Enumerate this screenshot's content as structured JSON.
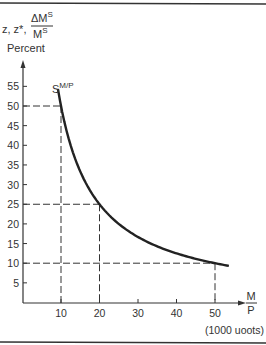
{
  "chart_data": {
    "type": "line",
    "title": "",
    "ylabel_lines": [
      "z, z*,",
      "ΔM",
      "S",
      "M",
      "S",
      "Percent"
    ],
    "ylabel": "z, z*, ΔM^S/M^S Percent",
    "xlabel": "M/P",
    "xlabel_num": "M",
    "xlabel_den": "P",
    "x_unit_note": "(1000 uoots)",
    "xlim": [
      0,
      55
    ],
    "ylim": [
      0,
      57
    ],
    "x_ticks": [
      10,
      20,
      30,
      40,
      50
    ],
    "y_ticks": [
      5,
      10,
      15,
      20,
      25,
      30,
      35,
      40,
      45,
      50,
      55
    ],
    "grid": false,
    "series": [
      {
        "name": "S^{M/P}",
        "label_base": "S",
        "label_sup": "M/P",
        "function": "y = 500 / x",
        "x_range": [
          9.2,
          53.6
        ],
        "x": [
          9.2,
          10,
          12,
          15,
          20,
          25,
          30,
          35,
          40,
          45,
          50,
          53.6
        ],
        "y": [
          54.3,
          50,
          41.7,
          33.3,
          25,
          20,
          16.7,
          14.3,
          12.5,
          11.1,
          10,
          9.3
        ]
      }
    ],
    "reference_lines": [
      {
        "x": 10,
        "y": 50
      },
      {
        "x": 20,
        "y": 25
      },
      {
        "x": 50,
        "y": 10
      }
    ]
  }
}
